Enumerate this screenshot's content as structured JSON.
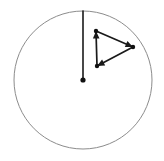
{
  "figure": {
    "title": "Vector triangle inside circle",
    "canvas": {
      "width": 164,
      "height": 161,
      "background": "#ffffff"
    },
    "colors": {
      "circle_stroke": "#8c8c8c",
      "vector_stroke": "#1a1a1a",
      "radius_stroke": "#1a1a1a",
      "point_fill": "#111111",
      "background": "#ffffff"
    },
    "circle": {
      "label": "outer circle",
      "center_x": 83,
      "center_y": 80,
      "radius": 69,
      "stroke_width": 1
    },
    "center_point": {
      "label": "circle center point",
      "x": 83,
      "y": 80,
      "radius": 2.6
    },
    "radius_line": {
      "label": "vertical radius from center to top of circle",
      "x1": 83,
      "y1": 80,
      "x2": 83,
      "y2": 11,
      "stroke_width": 1.6
    },
    "triangle": {
      "label": "closed loop of three vectors",
      "vertices": [
        {
          "name": "top-left vertex",
          "x": 96,
          "y": 31
        },
        {
          "name": "right vertex",
          "x": 133,
          "y": 47
        },
        {
          "name": "bottom-left vertex",
          "x": 97,
          "y": 66
        }
      ],
      "vectors": [
        {
          "name": "vector-bottom-to-top",
          "from_x": 97,
          "from_y": 66,
          "to_x": 96,
          "to_y": 31,
          "arrow_direction": "up",
          "stroke_width": 1.7
        },
        {
          "name": "vector-top-to-right",
          "from_x": 96,
          "from_y": 31,
          "to_x": 133,
          "to_y": 47,
          "arrow_direction": "right-down",
          "stroke_width": 1.7
        },
        {
          "name": "vector-right-to-bottom",
          "from_x": 133,
          "from_y": 47,
          "to_x": 97,
          "to_y": 66,
          "arrow_direction": "left-down",
          "stroke_width": 1.7
        }
      ],
      "vertex_dot_radius": 2.2
    }
  }
}
